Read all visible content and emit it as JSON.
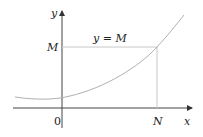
{
  "diagram": {
    "axes": {
      "x_label": "x",
      "y_label": "y",
      "origin_label": "0"
    },
    "labels": {
      "line_label": "y = M",
      "y_tick": "M",
      "x_tick": "N"
    },
    "colors": {
      "axis": "#333333",
      "curve": "#b0b0b0",
      "guide": "#c8c8c8",
      "text": "#222222"
    }
  }
}
